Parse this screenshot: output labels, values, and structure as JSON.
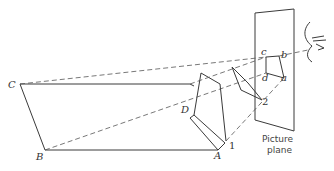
{
  "figure": {
    "labels": {
      "A": "A",
      "B": "B",
      "C": "C",
      "D": "D",
      "a": "a",
      "b": "b",
      "c": "c",
      "d": "d",
      "one": "1",
      "two": "2"
    },
    "caption": {
      "line1": "Picture",
      "line2": "plane"
    },
    "colors": {
      "line": "#3a3a3a",
      "background": "#ffffff"
    }
  }
}
